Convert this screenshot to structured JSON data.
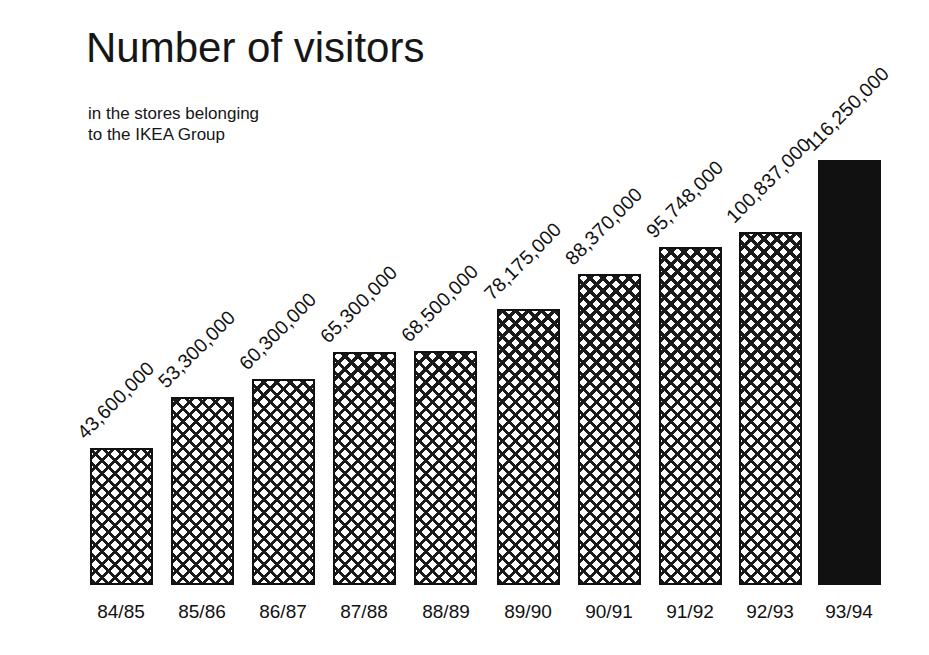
{
  "title": "Number of visitors",
  "subtitle": "in the stores belonging\nto the IKEA Group",
  "chart_data": {
    "type": "bar",
    "title": "Number of visitors",
    "subtitle": "in the stores belonging to the IKEA Group",
    "xlabel": "",
    "ylabel": "",
    "categories": [
      "84/85",
      "85/86",
      "86/87",
      "87/88",
      "88/89",
      "89/90",
      "90/91",
      "91/92",
      "92/93",
      "93/94"
    ],
    "values": [
      43600000,
      53300000,
      65300000,
      68500000,
      78175000,
      88370000,
      95748000,
      100837000,
      116250000,
      116250000
    ],
    "value_labels": [
      "43,600,000",
      "53,300,000",
      "60,300,000",
      "65,300,000",
      "68,500,000",
      "78,175,000",
      "88,370,000",
      "95,748,000",
      "100,837,000",
      "116,250,000"
    ],
    "series": [
      {
        "name": "Number of visitors",
        "values": [
          43600000,
          53300000,
          60300000,
          65300000,
          68500000,
          78175000,
          88370000,
          95748000,
          100837000,
          116250000
        ]
      }
    ],
    "ylim": [
      0,
      116250000
    ],
    "grid": false,
    "legend": false,
    "bar_styles": [
      "hatched",
      "hatched",
      "hatched",
      "hatched",
      "hatched",
      "hatched",
      "hatched",
      "hatched",
      "hatched",
      "solid"
    ],
    "colors": {
      "bar_outline": "#111111",
      "bar_fill": "#ffffff",
      "bar_hatch": "#1a1a1a",
      "bar_highlight": "#111111",
      "text": "#111111",
      "background": "#ffffff"
    }
  },
  "bars": [
    {
      "category": "84/85",
      "value_label": "43,600,000",
      "left": 90,
      "top": 448,
      "width": 63,
      "height": 137,
      "style": "hatched",
      "label_x": 88,
      "label_y": 443
    },
    {
      "category": "85/86",
      "value_label": "53,300,000",
      "left": 171,
      "top": 397,
      "width": 63,
      "height": 188,
      "style": "hatched",
      "label_x": 169,
      "label_y": 392
    },
    {
      "category": "86/87",
      "value_label": "60,300,000",
      "left": 252,
      "top": 379,
      "width": 63,
      "height": 206,
      "style": "hatched",
      "label_x": 250,
      "label_y": 374
    },
    {
      "category": "87/88",
      "value_label": "65,300,000",
      "left": 333,
      "top": 352,
      "width": 63,
      "height": 233,
      "style": "hatched",
      "label_x": 331,
      "label_y": 347
    },
    {
      "category": "88/89",
      "value_label": "68,500,000",
      "left": 414,
      "top": 351,
      "width": 63,
      "height": 234,
      "style": "hatched",
      "label_x": 412,
      "label_y": 346
    },
    {
      "category": "89/90",
      "value_label": "78,175,000",
      "left": 497,
      "top": 309,
      "width": 63,
      "height": 276,
      "style": "hatched",
      "label_x": 495,
      "label_y": 304
    },
    {
      "category": "90/91",
      "value_label": "88,370,000",
      "left": 578,
      "top": 274,
      "width": 63,
      "height": 311,
      "style": "hatched",
      "label_x": 576,
      "label_y": 269
    },
    {
      "category": "91/92",
      "value_label": "95,748,000",
      "left": 659,
      "top": 247,
      "width": 63,
      "height": 338,
      "style": "hatched",
      "label_x": 657,
      "label_y": 242
    },
    {
      "category": "92/93",
      "value_label": "100,837,000",
      "left": 739,
      "top": 232,
      "width": 63,
      "height": 353,
      "style": "hatched",
      "label_x": 737,
      "label_y": 227
    },
    {
      "category": "93/94",
      "value_label": "116,250,000",
      "left": 818,
      "top": 160,
      "width": 63,
      "height": 425,
      "style": "solid",
      "label_x": 816,
      "label_y": 155
    }
  ],
  "category_labels": [
    {
      "text": "84/85",
      "center": 121
    },
    {
      "text": "85/86",
      "center": 202
    },
    {
      "text": "86/87",
      "center": 283
    },
    {
      "text": "87/88",
      "center": 364
    },
    {
      "text": "88/89",
      "center": 446
    },
    {
      "text": "89/90",
      "center": 528
    },
    {
      "text": "90/91",
      "center": 609
    },
    {
      "text": "91/92",
      "center": 690
    },
    {
      "text": "92/93",
      "center": 770
    },
    {
      "text": "93/94",
      "center": 849
    }
  ],
  "axis": {
    "baseline_y": 585,
    "label_y": 601
  }
}
